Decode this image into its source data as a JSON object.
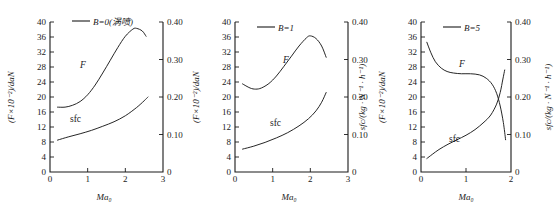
{
  "figure": {
    "panel_count": 3,
    "shared": {
      "ylabel_left": "(F×10⁻²)/daN",
      "ylabel_right": "sfc/(kg · N⁻¹ · h⁻¹)",
      "xlabel": "Ma₀",
      "curve_label_f": "F",
      "curve_label_sfc": "sfc"
    }
  },
  "chart_data": [
    {
      "type": "line",
      "title": "B=0(涡喷)",
      "legend": [
        "B=0(涡喷)"
      ],
      "xlabel": "Ma₀",
      "ylabel": "(F×10⁻²)/daN",
      "ylabel_right": "sfc/(kg · N⁻¹ · h⁻¹)",
      "xlim": [
        0,
        3
      ],
      "ylim": [
        0,
        40
      ],
      "ylim_right": [
        0,
        0.4
      ],
      "xticks": [
        0,
        1,
        2,
        3
      ],
      "yticks": [
        0,
        4,
        8,
        12,
        16,
        20,
        24,
        28,
        32,
        36,
        40
      ],
      "yticks_right": [
        0,
        0.1,
        0.2,
        0.3,
        0.4
      ],
      "grid": false,
      "series": [
        {
          "name": "F",
          "axis": "left",
          "x": [
            0.2,
            0.4,
            0.6,
            0.8,
            1.0,
            1.2,
            1.4,
            1.6,
            1.8,
            2.0,
            2.2,
            2.3,
            2.45,
            2.55
          ],
          "values": [
            17.3,
            17.3,
            17.8,
            18.8,
            20.6,
            23.2,
            26.4,
            29.8,
            33.2,
            36.2,
            38.1,
            38.3,
            37.6,
            36.2
          ]
        },
        {
          "name": "sfc",
          "axis": "right",
          "x": [
            0.2,
            0.5,
            0.8,
            1.1,
            1.4,
            1.7,
            2.0,
            2.3,
            2.5,
            2.6
          ],
          "values": [
            0.085,
            0.094,
            0.102,
            0.111,
            0.122,
            0.134,
            0.15,
            0.172,
            0.19,
            0.2
          ]
        }
      ]
    },
    {
      "type": "line",
      "title": "B=1",
      "legend": [
        "B=1"
      ],
      "xlabel": "Ma₀",
      "ylabel": "(F×10⁻²)/daN",
      "ylabel_right": "sfc/(kg · N⁻¹ · h⁻¹)",
      "xlim": [
        0,
        3
      ],
      "ylim": [
        0,
        40
      ],
      "ylim_right": [
        0,
        0.4
      ],
      "xticks": [
        0,
        1,
        2,
        3
      ],
      "yticks": [
        0,
        4,
        8,
        12,
        16,
        20,
        24,
        28,
        32,
        36,
        40
      ],
      "yticks_right": [
        0,
        0.1,
        0.2,
        0.3,
        0.4
      ],
      "grid": false,
      "series": [
        {
          "name": "F",
          "axis": "left",
          "x": [
            0.2,
            0.4,
            0.55,
            0.7,
            0.9,
            1.1,
            1.3,
            1.5,
            1.7,
            1.9,
            2.0,
            2.15,
            2.3,
            2.42
          ],
          "values": [
            23.5,
            22.4,
            22.1,
            22.4,
            23.6,
            25.6,
            28.2,
            30.9,
            33.6,
            35.8,
            36.3,
            35.6,
            33.6,
            30.6
          ]
        },
        {
          "name": "sfc",
          "axis": "right",
          "x": [
            0.2,
            0.5,
            0.8,
            1.1,
            1.4,
            1.7,
            1.95,
            2.15,
            2.3,
            2.42
          ],
          "values": [
            0.061,
            0.069,
            0.079,
            0.091,
            0.105,
            0.123,
            0.142,
            0.163,
            0.186,
            0.212
          ]
        }
      ]
    },
    {
      "type": "line",
      "title": "B=5",
      "legend": [
        "B=5"
      ],
      "xlabel": "Ma₀",
      "ylabel": "(F×10⁻²)/daN",
      "ylabel_right": "sfc/(kg · N⁻¹ · h⁻¹)",
      "xlim": [
        0,
        2
      ],
      "ylim": [
        0,
        40
      ],
      "ylim_right": [
        0,
        0.4
      ],
      "xticks": [
        0,
        1,
        2
      ],
      "yticks": [
        0,
        4,
        8,
        12,
        16,
        20,
        24,
        28,
        32,
        36,
        40
      ],
      "yticks_right": [
        0,
        0.1,
        0.2,
        0.3,
        0.4
      ],
      "grid": false,
      "series": [
        {
          "name": "F",
          "axis": "left",
          "x": [
            0.13,
            0.22,
            0.32,
            0.45,
            0.58,
            0.72,
            0.9,
            1.1,
            1.3,
            1.45,
            1.58,
            1.68,
            1.76,
            1.83,
            1.88
          ],
          "values": [
            34.6,
            31.8,
            29.4,
            27.7,
            26.8,
            26.4,
            26.2,
            26.2,
            25.9,
            25.0,
            23.4,
            21.0,
            17.6,
            13.2,
            8.6
          ]
        },
        {
          "name": "sfc",
          "axis": "right",
          "x": [
            0.13,
            0.25,
            0.4,
            0.6,
            0.8,
            1.0,
            1.2,
            1.4,
            1.55,
            1.68,
            1.76,
            1.82,
            1.86
          ],
          "values": [
            0.036,
            0.047,
            0.06,
            0.074,
            0.086,
            0.098,
            0.113,
            0.133,
            0.152,
            0.181,
            0.212,
            0.248,
            0.272
          ]
        }
      ]
    }
  ]
}
